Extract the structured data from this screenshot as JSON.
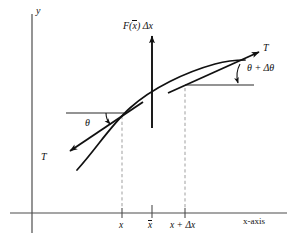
{
  "figure": {
    "type": "physics-diagram",
    "background_color": "#ffffff",
    "line_color": "#111111",
    "guide_color": "#6f6f6f",
    "dash_color": "#a8a8a8"
  },
  "axes": {
    "y_label": "y",
    "x_label": "x-axis",
    "x_axis_y": 213,
    "y_axis_x": 32
  },
  "ticks": [
    {
      "label": "x",
      "x": 122,
      "bar": false
    },
    {
      "label": "x",
      "x": 152,
      "bar": true
    },
    {
      "label": "x + Δx",
      "x": 185,
      "bar": false
    }
  ],
  "load": {
    "label": "F(x) Δx",
    "label_prefix": "F(",
    "label_barred": "x",
    "label_suffix": ") Δx",
    "arrow_x": 152,
    "arrow_from_y": 128,
    "arrow_to_y": 35
  },
  "tension_left": {
    "label": "T",
    "angle_label": "θ",
    "tail_x": 140,
    "tail_y": 105,
    "head_x": 68,
    "head_y": 152
  },
  "tension_right": {
    "label": "T",
    "angle_label": "θ + Δθ",
    "tail_x": 170,
    "tail_y": 92,
    "head_x": 258,
    "head_y": 52
  },
  "tangent_points": {
    "left": {
      "x": 122,
      "y": 113
    },
    "right": {
      "x": 185,
      "y": 85
    }
  },
  "curve": {
    "start": {
      "x": 77,
      "y": 170
    },
    "end": {
      "x": 245,
      "y": 61
    },
    "shape": "concave-down increasing"
  }
}
